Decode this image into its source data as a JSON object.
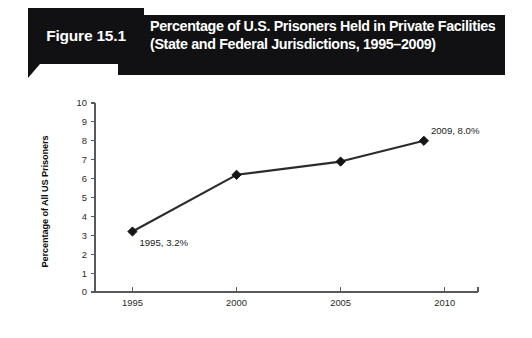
{
  "figure": {
    "tab_label": "Figure 15.1",
    "title_line1": "Percentage of U.S. Prisoners Held in Private Facilities",
    "title_line2": "(State and Federal Jurisdictions, 1995–2009)",
    "banner_color": "#111012",
    "banner_text_color": "#ffffff"
  },
  "chart_data": {
    "type": "line",
    "title": "Percentage of U.S. Prisoners Held in Private Facilities (State and Federal Jurisdictions, 1995–2009)",
    "xlabel": "",
    "ylabel": "Percentage of All US Prisoners",
    "x": [
      1995,
      2000,
      2005,
      2009
    ],
    "values": [
      3.2,
      6.2,
      6.9,
      8.0
    ],
    "series": [
      {
        "name": "Percentage of All US Prisoners",
        "values": [
          3.2,
          6.2,
          6.9,
          8.0
        ],
        "color": "#2b2b2b",
        "marker": "diamond"
      }
    ],
    "point_labels": [
      {
        "text": "1995, 3.2%",
        "x": 1995,
        "y": 3.2,
        "position": "below-right"
      },
      {
        "text": "2009, 8.0%",
        "x": 2009,
        "y": 8.0,
        "position": "above-right"
      }
    ],
    "xlim": [
      1993.2,
      2011.6
    ],
    "ylim": [
      0,
      10
    ],
    "xticks": [
      1995,
      2000,
      2005,
      2010
    ],
    "xtick_labels": [
      "1995",
      "2000",
      "2005",
      "2010"
    ],
    "yticks": [
      0,
      1,
      2,
      3,
      4,
      5,
      6,
      7,
      8,
      9,
      10
    ],
    "ytick_labels": [
      "0",
      "1",
      "2",
      "3",
      "4",
      "5",
      "6",
      "7",
      "8",
      "9",
      "10"
    ],
    "grid": false,
    "legend": false,
    "axis_color": "#58595b",
    "background": "#ffffff"
  }
}
